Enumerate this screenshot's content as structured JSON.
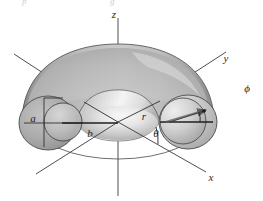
{
  "figure": {
    "kind": "torus-spherical-coordinates-diagram",
    "background_color": "#ffffff",
    "width": 263,
    "height": 201,
    "clipped_text_above": {
      "fragment_left": "p",
      "fragment_right": "g"
    }
  },
  "axes": {
    "z": {
      "label": "z",
      "label_x": 118,
      "label_y": 14,
      "direction": "vertical-up"
    },
    "y": {
      "label": "y",
      "label_x": 229,
      "label_y": 59,
      "direction": "upper-right"
    },
    "x": {
      "label": "x",
      "label_x": 211,
      "label_y": 178,
      "direction": "lower-right"
    }
  },
  "dimensions": {
    "minor_radius": {
      "label": "a",
      "label_x": 33,
      "label_y": 119,
      "description": "tube radius of the torus"
    },
    "major_radius": {
      "label": "b",
      "label_x": 90,
      "label_y": 134,
      "description": "distance from origin to tube center"
    },
    "radial": {
      "label": "r",
      "label_x": 143,
      "label_y": 118,
      "description": "radial distance from origin to point on tube"
    }
  },
  "angles": {
    "theta": {
      "label": "θ",
      "label_x": 156,
      "label_y": 134,
      "description": "polar angle measured from x-axis in the equatorial plane"
    },
    "phi": {
      "label": "ϕ",
      "label_x": 248,
      "label_y": 90,
      "description": "azimuthal angle about the tube cross-section"
    }
  },
  "colors": {
    "surface_light": "#f2f2f2",
    "surface_mid": "#b8b8b8",
    "surface_dark": "#8e8e8e",
    "surface_shadow": "#6f6f6f",
    "outline": "#4a4a4a",
    "axis_line": "#3a3a3a",
    "label_text": "#1f1f1f",
    "cross_section_fill": "#a9a9a9"
  },
  "elements": {
    "torus_body": "shaded grey torus surface",
    "left_cross_section": "elliptical cut face at negative x showing tube interior",
    "right_cross_section": "elliptical cut face at positive x with phi arrow",
    "equatorial_ellipse": "thin outline ellipse of the torus centerline circle",
    "phi_arrow": "arrow from tube center to surface point indicating phi",
    "r_leader": "leader line from origin toward r label",
    "theta_leader": "leader line from origin along theta ray"
  }
}
